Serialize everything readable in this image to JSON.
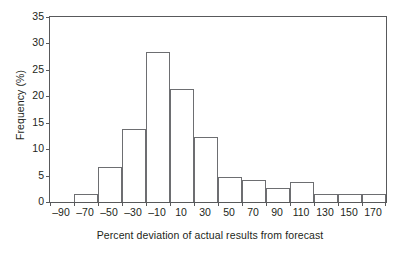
{
  "chart_data": {
    "type": "bar",
    "title": "",
    "subtitle": "",
    "xlabel": "Percent deviation of actual results from forecast",
    "ylabel": "Frequency (%)",
    "categories": [
      "-90",
      "-70",
      "-50",
      "-30",
      "-10",
      "10",
      "30",
      "50",
      "70",
      "90",
      "110",
      "130",
      "150",
      "170"
    ],
    "tick_labels_x": [
      "–90",
      "–70",
      "–50",
      "–30",
      "–10",
      "10",
      "30",
      "50",
      "70",
      "90",
      "110",
      "130",
      "150",
      "170"
    ],
    "tick_labels_y": [
      "0",
      "5",
      "10",
      "15",
      "20",
      "25",
      "30",
      "35"
    ],
    "values": [
      0,
      1.5,
      6.7,
      13.9,
      28.3,
      21.3,
      12.3,
      4.7,
      4.2,
      2.6,
      3.7,
      1.5,
      1.5,
      1.5
    ],
    "bin_edges": [
      -100,
      -80,
      -60,
      -40,
      -20,
      0,
      20,
      40,
      60,
      80,
      100,
      120,
      140,
      160,
      180
    ],
    "bin_width": 20,
    "xlim": [
      -100,
      180
    ],
    "ylim": [
      0,
      35
    ],
    "ytick_step": 5,
    "grid": false,
    "legend": null,
    "legend_position": "none",
    "bar_fill": "#ffffff",
    "bar_edge_color": "#6d6e71",
    "axis_color": "#58595b",
    "text_color": "#231f20",
    "background": "#ffffff"
  }
}
